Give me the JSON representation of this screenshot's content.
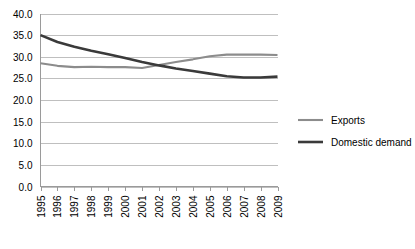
{
  "chart_data": {
    "type": "line",
    "title": "",
    "xlabel": "",
    "ylabel": "",
    "categories": [
      "1995",
      "1996",
      "1997",
      "1998",
      "1999",
      "2000",
      "2001",
      "2002",
      "2003",
      "2004",
      "2005",
      "2006",
      "2007",
      "2008",
      "2009"
    ],
    "ylim": [
      0.0,
      40.0
    ],
    "ytick_step": 5.0,
    "yticks": [
      "40.0",
      "35.0",
      "30.0",
      "25.0",
      "20.0",
      "15.0",
      "10.0",
      "5.0",
      "0.0"
    ],
    "grid": true,
    "legend_position": "right",
    "series": [
      {
        "name": "Exports",
        "color": "#8c8c8c",
        "stroke_width": 2.1,
        "values": [
          28.5,
          27.9,
          27.6,
          27.7,
          27.6,
          27.6,
          27.4,
          28.1,
          28.8,
          29.4,
          30.1,
          30.5,
          30.5,
          30.5,
          30.4
        ]
      },
      {
        "name": "Domestic demand",
        "color": "#3a3a3a",
        "stroke_width": 2.6,
        "values": [
          35.0,
          33.4,
          32.3,
          31.4,
          30.6,
          29.7,
          28.8,
          28.0,
          27.3,
          26.7,
          26.1,
          25.5,
          25.2,
          25.2,
          25.4
        ]
      }
    ]
  },
  "legend": {
    "items": [
      {
        "label": "Exports"
      },
      {
        "label": "Domestic demand"
      }
    ]
  }
}
